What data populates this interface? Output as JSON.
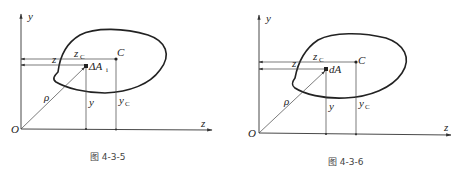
{
  "figures": [
    {
      "caption": "图  4-3-5",
      "axis_y_label": "y",
      "axis_z_label": "z",
      "origin_label": "O",
      "centroid_label": "C",
      "element_label": "ΔA",
      "element_sub": "i",
      "zc_label": "z",
      "zc_sub": "C",
      "z_label": "z",
      "y_label": "y",
      "yc_label": "y",
      "yc_sub": "C",
      "rho_label": "ρ"
    },
    {
      "caption": "图  4-3-6",
      "axis_y_label": "y",
      "axis_z_label": "z",
      "origin_label": "O",
      "centroid_label": "C",
      "element_label": "dA",
      "zc_label": "z",
      "zc_sub": "C",
      "z_label": "z",
      "y_label": "y",
      "yc_label": "y",
      "yc_sub": "C",
      "rho_label": "ρ"
    }
  ]
}
